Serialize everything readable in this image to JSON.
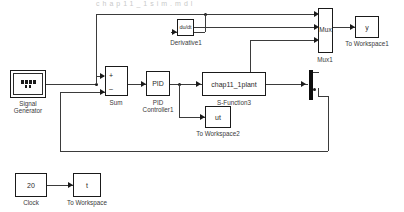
{
  "diagram": {
    "type": "simulink-block-diagram",
    "title_sliver": "chap11_1sim.mdl",
    "background_color": "#ffffff",
    "line_color": "#3b3b3b",
    "block_border_color": "#1a1a1a"
  },
  "blocks": {
    "signal_generator": {
      "label": "",
      "caption": "Signal\nGenerator",
      "caption_line1": "Signal",
      "caption_line2": "Generator"
    },
    "sum": {
      "label": "",
      "caption": "Sum",
      "plus_sign": "+",
      "minus_sign": "–"
    },
    "pid_controller": {
      "label": "PID",
      "caption_line1": "PID",
      "caption_line2": "Controller1"
    },
    "s_function": {
      "label": "chap11_1plant",
      "caption": "S-Function3"
    },
    "derivative": {
      "label": "du/dt",
      "caption": "Derivative1"
    },
    "mux": {
      "label": "Mux",
      "caption": "Mux1"
    },
    "to_workspace1": {
      "label": "y",
      "caption": "To Workspace1"
    },
    "to_workspace2": {
      "label": "ut",
      "caption": "To Workspace2"
    },
    "clock": {
      "label": "20",
      "caption": "Clock"
    },
    "to_workspace": {
      "label": "t",
      "caption": "To Workspace"
    },
    "demux": {
      "label": "",
      "caption": ""
    }
  }
}
